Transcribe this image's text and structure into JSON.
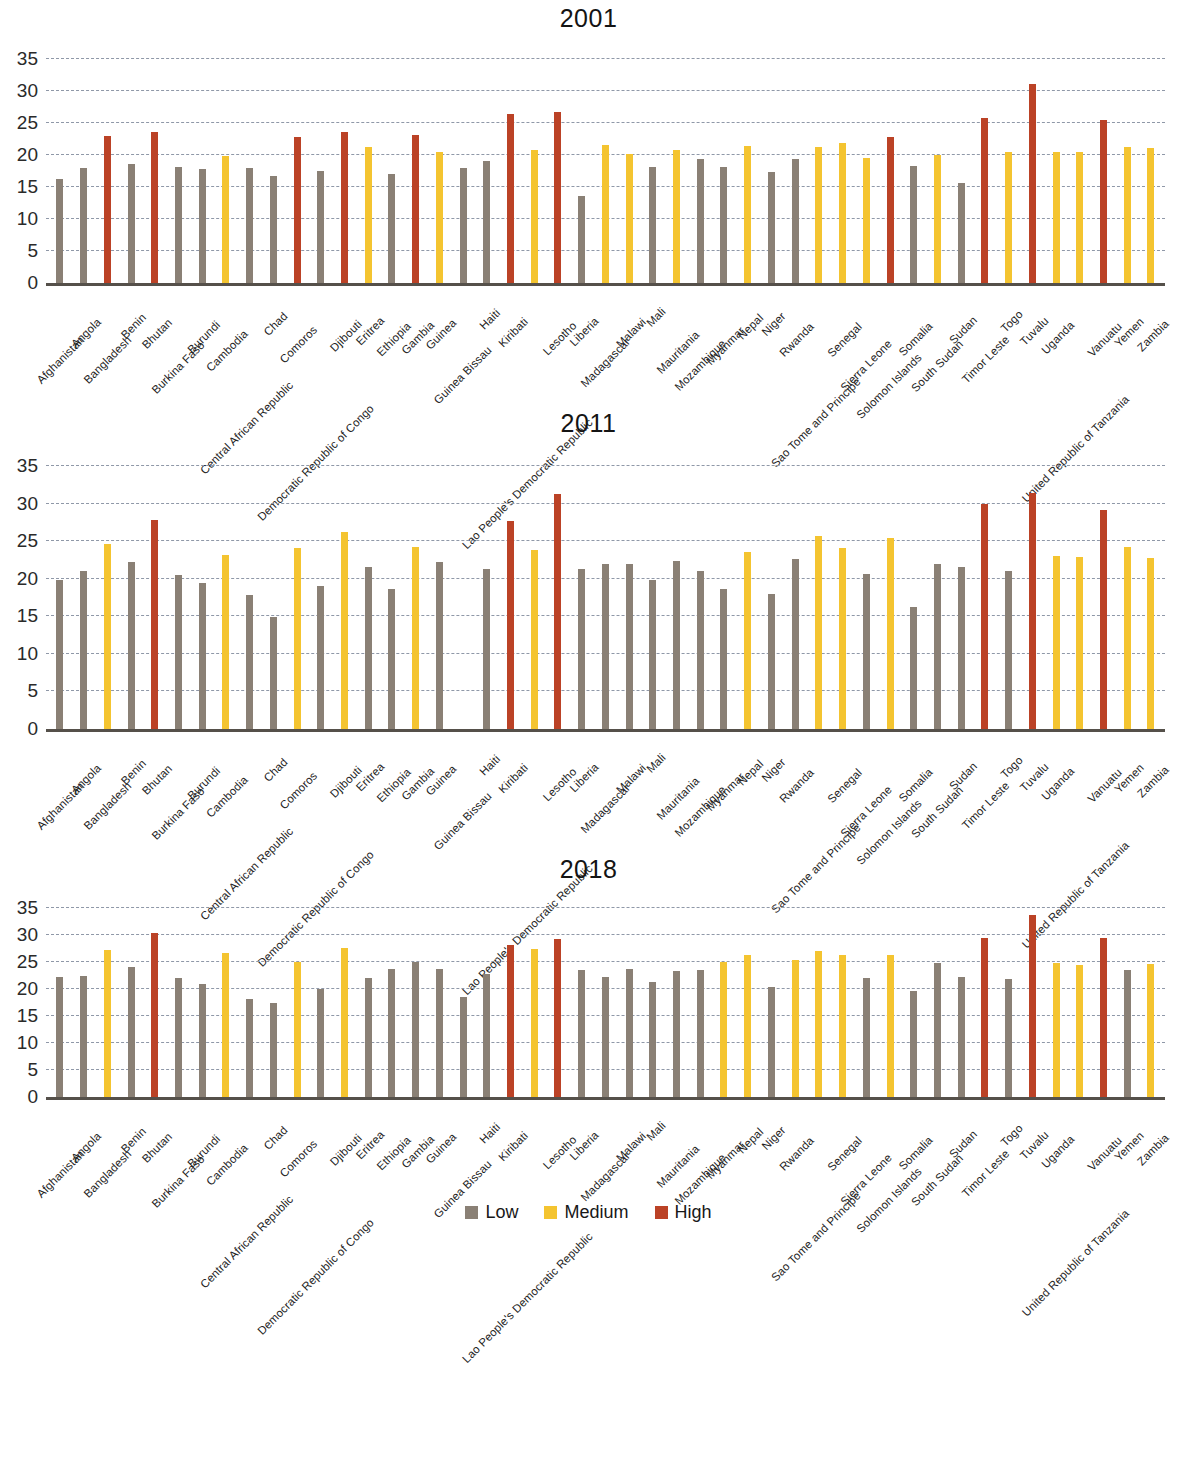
{
  "colors": {
    "low": "#8a8075",
    "medium": "#f4c430",
    "high": "#bb4226",
    "gridline": "#8f98a8",
    "axis": "#55504a"
  },
  "legend": {
    "position": "bottom-center",
    "items": [
      {
        "label": "Low",
        "key": "low",
        "color": "#8a8075"
      },
      {
        "label": "Medium",
        "key": "medium",
        "color": "#f4c430"
      },
      {
        "label": "High",
        "key": "high",
        "color": "#bb4226"
      }
    ]
  },
  "axis": {
    "yticks": [
      0,
      5,
      10,
      15,
      20,
      25,
      30,
      35
    ],
    "ylim": [
      0,
      36.5
    ],
    "grid": true
  },
  "categories": [
    "Afghanistan",
    "Angola",
    "Bangladesh",
    "Benin",
    "Bhutan",
    "Burkina Faso",
    "Burundi",
    "Cambodia",
    "Central African Republic",
    "Chad",
    "Comoros",
    "Democratic Republic of Congo",
    "Djibouti",
    "Eritrea",
    "Ethiopia",
    "Gambia",
    "Guinea",
    "Guinea Bissau",
    "Haiti",
    "Kiribati",
    "Lao People's Democratic Republic",
    "Lesotho",
    "Liberia",
    "Madagascar",
    "Malawi",
    "Mali",
    "Mauritania",
    "Mozambique",
    "Myanmar",
    "Nepal",
    "Niger",
    "Rwanda",
    "Sao Tome and Principe",
    "Senegal",
    "Sierra Leone",
    "Solomon Islands",
    "Somalia",
    "South Sudan",
    "Sudan",
    "Timor Leste",
    "Togo",
    "Tuvalu",
    "Uganda",
    "United Republic of Tanzania",
    "Vanuatu",
    "Yemen",
    "Zambia"
  ],
  "chart_data": [
    {
      "type": "bar",
      "title": "2001",
      "xlabel": "",
      "ylabel": "",
      "ylim": [
        0,
        36.5
      ],
      "yticks": [
        0,
        5,
        10,
        15,
        20,
        25,
        30,
        35
      ],
      "grid": true,
      "legend_position": "bottom-center",
      "categories": [
        "Afghanistan",
        "Angola",
        "Bangladesh",
        "Benin",
        "Bhutan",
        "Burkina Faso",
        "Burundi",
        "Cambodia",
        "Central African Republic",
        "Chad",
        "Comoros",
        "Democratic Republic of Congo",
        "Djibouti",
        "Eritrea",
        "Ethiopia",
        "Gambia",
        "Guinea",
        "Guinea Bissau",
        "Haiti",
        "Kiribati",
        "Lao People's Democratic Republic",
        "Lesotho",
        "Liberia",
        "Madagascar",
        "Malawi",
        "Mali",
        "Mauritania",
        "Mozambique",
        "Myanmar",
        "Nepal",
        "Niger",
        "Rwanda",
        "Sao Tome and Principe",
        "Senegal",
        "Sierra Leone",
        "Solomon Islands",
        "Somalia",
        "South Sudan",
        "Sudan",
        "Timor Leste",
        "Togo",
        "Tuvalu",
        "Uganda",
        "United Republic of Tanzania",
        "Vanuatu",
        "Yemen",
        "Zambia"
      ],
      "values": [
        16.2,
        18.0,
        23.0,
        18.5,
        23.5,
        18.1,
        17.8,
        19.8,
        18.0,
        16.7,
        22.8,
        17.5,
        23.5,
        21.2,
        17.0,
        23.1,
        20.5,
        18.0,
        19.0,
        26.4,
        20.7,
        26.7,
        13.5,
        21.5,
        20.2,
        18.1,
        20.8,
        19.3,
        18.1,
        21.4,
        17.3,
        19.4,
        21.2,
        21.8,
        19.5,
        22.8,
        18.2,
        20.0,
        15.6,
        25.7,
        20.4,
        31.0,
        20.4,
        20.5,
        25.4,
        21.2,
        21.0
      ],
      "levels": [
        "low",
        "low",
        "high",
        "low",
        "high",
        "low",
        "low",
        "medium",
        "low",
        "low",
        "high",
        "low",
        "high",
        "medium",
        "low",
        "high",
        "medium",
        "low",
        "low",
        "high",
        "medium",
        "high",
        "low",
        "medium",
        "medium",
        "low",
        "medium",
        "low",
        "low",
        "medium",
        "low",
        "low",
        "medium",
        "medium",
        "medium",
        "high",
        "low",
        "medium",
        "low",
        "high",
        "medium",
        "high",
        "medium",
        "medium",
        "high",
        "medium",
        "medium"
      ]
    },
    {
      "type": "bar",
      "title": "2011",
      "xlabel": "",
      "ylabel": "",
      "ylim": [
        0,
        36.5
      ],
      "yticks": [
        0,
        5,
        10,
        15,
        20,
        25,
        30,
        35
      ],
      "grid": true,
      "legend_position": "bottom-center",
      "categories": [
        "Afghanistan",
        "Angola",
        "Bangladesh",
        "Benin",
        "Bhutan",
        "Burkina Faso",
        "Burundi",
        "Cambodia",
        "Central African Republic",
        "Chad",
        "Comoros",
        "Democratic Republic of Congo",
        "Djibouti",
        "Eritrea",
        "Ethiopia",
        "Gambia",
        "Guinea",
        "Guinea Bissau",
        "Haiti",
        "Kiribati",
        "Lao People's Democratic Republic",
        "Lesotho",
        "Liberia",
        "Madagascar",
        "Malawi",
        "Mali",
        "Mauritania",
        "Mozambique",
        "Myanmar",
        "Nepal",
        "Niger",
        "Rwanda",
        "Sao Tome and Principe",
        "Senegal",
        "Sierra Leone",
        "Solomon Islands",
        "Somalia",
        "South Sudan",
        "Sudan",
        "Timor Leste",
        "Togo",
        "Tuvalu",
        "Uganda",
        "United Republic of Tanzania",
        "Vanuatu",
        "Yemen",
        "Zambia"
      ],
      "values": [
        19.9,
        21.1,
        24.7,
        22.3,
        27.9,
        20.5,
        19.5,
        23.2,
        17.8,
        14.9,
        24.1,
        19.1,
        26.3,
        21.6,
        18.7,
        24.2,
        22.2,
        null,
        21.3,
        27.7,
        23.9,
        31.3,
        21.3,
        22.0,
        22.0,
        19.9,
        22.4,
        21.1,
        18.6,
        23.6,
        18.0,
        22.7,
        25.7,
        24.1,
        20.6,
        25.5,
        16.3,
        22.0,
        21.6,
        30.0,
        21.1,
        31.4,
        23.1,
        22.9,
        29.2,
        24.2,
        22.8
      ],
      "levels": [
        "low",
        "low",
        "medium",
        "low",
        "high",
        "low",
        "low",
        "medium",
        "low",
        "low",
        "medium",
        "low",
        "medium",
        "low",
        "low",
        "medium",
        "low",
        null,
        "low",
        "high",
        "medium",
        "high",
        "low",
        "low",
        "low",
        "low",
        "low",
        "low",
        "low",
        "medium",
        "low",
        "low",
        "medium",
        "medium",
        "low",
        "medium",
        "low",
        "low",
        "low",
        "high",
        "low",
        "high",
        "medium",
        "medium",
        "high",
        "medium",
        "medium"
      ]
    },
    {
      "type": "bar",
      "title": "2018",
      "xlabel": "",
      "ylabel": "",
      "ylim": [
        0,
        36.5
      ],
      "yticks": [
        0,
        5,
        10,
        15,
        20,
        25,
        30,
        35
      ],
      "grid": true,
      "legend_position": "bottom-center",
      "categories": [
        "Afghanistan",
        "Angola",
        "Bangladesh",
        "Benin",
        "Bhutan",
        "Burkina Faso",
        "Burundi",
        "Cambodia",
        "Central African Republic",
        "Chad",
        "Comoros",
        "Democratic Republic of Congo",
        "Djibouti",
        "Eritrea",
        "Ethiopia",
        "Gambia",
        "Guinea",
        "Guinea Bissau",
        "Haiti",
        "Kiribati",
        "Lao People's Democratic Republic",
        "Lesotho",
        "Liberia",
        "Madagascar",
        "Malawi",
        "Mali",
        "Mauritania",
        "Mozambique",
        "Myanmar",
        "Nepal",
        "Niger",
        "Rwanda",
        "Sao Tome and Principe",
        "Senegal",
        "Sierra Leone",
        "Solomon Islands",
        "Somalia",
        "South Sudan",
        "Sudan",
        "Timor Leste",
        "Togo",
        "Tuvalu",
        "Uganda",
        "United Republic of Tanzania",
        "Vanuatu",
        "Yemen",
        "Zambia"
      ],
      "values": [
        22.2,
        22.4,
        27.2,
        24.1,
        30.3,
        22.0,
        20.9,
        26.7,
        18.2,
        17.4,
        25.0,
        20.1,
        27.7,
        22.0,
        23.8,
        25.0,
        23.8,
        18.5,
        22.7,
        28.2,
        27.4,
        29.3,
        23.5,
        22.3,
        23.7,
        21.4,
        23.3,
        23.6,
        25.1,
        26.4,
        20.3,
        25.4,
        27.0,
        26.4,
        22.1,
        26.4,
        19.7,
        24.8,
        22.3,
        29.5,
        21.9,
        33.8,
        24.9,
        24.4,
        29.5,
        23.5,
        24.7
      ],
      "levels": [
        "low",
        "low",
        "medium",
        "low",
        "high",
        "low",
        "low",
        "medium",
        "low",
        "low",
        "medium",
        "low",
        "medium",
        "low",
        "low",
        "low",
        "low",
        "low",
        "low",
        "high",
        "medium",
        "high",
        "low",
        "low",
        "low",
        "low",
        "low",
        "low",
        "medium",
        "medium",
        "low",
        "medium",
        "medium",
        "medium",
        "low",
        "medium",
        "low",
        "low",
        "low",
        "high",
        "low",
        "high",
        "medium",
        "medium",
        "high",
        "low",
        "medium"
      ]
    }
  ]
}
